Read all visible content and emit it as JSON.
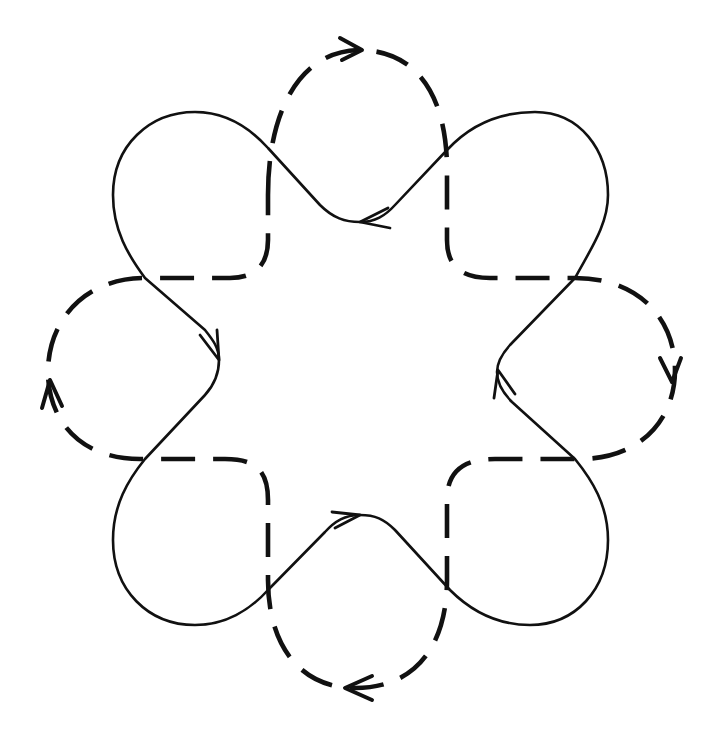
{
  "diagram": {
    "title": "Two interlinked oriented closed curves (solid and dashed) with eight-fold lobed pattern",
    "canvas": {
      "width": 714,
      "height": 739,
      "background": "#ffffff"
    },
    "curves": [
      {
        "id": "solid",
        "style": "solid",
        "color": "#111111",
        "description": "Closed curve with four outer corner lobes and four inward V-turns",
        "lobes": [
          "top-left",
          "top-right",
          "bottom-right",
          "bottom-left"
        ],
        "v_turns": [
          {
            "position": "top",
            "tip": [
              355,
              222
            ],
            "arrow": "pointing-left"
          },
          {
            "position": "right",
            "tip": [
              497,
              372
            ],
            "arrow": "pointing-up"
          },
          {
            "position": "bottom",
            "tip": [
              360,
              515
            ],
            "arrow": "pointing-right"
          },
          {
            "position": "left",
            "tip": [
              219,
              360
            ],
            "arrow": "pointing-down"
          }
        ]
      },
      {
        "id": "dashed",
        "style": "dashed",
        "color": "#111111",
        "description": "Closed dashed curve with four outer lobes (top, right, bottom, left) joined by rounded inner corners",
        "lobes": [
          {
            "position": "top",
            "extreme": [
              358,
              50
            ],
            "arrow": "pointing-right"
          },
          {
            "position": "right",
            "extreme": [
              675,
              370
            ],
            "arrow": "pointing-down"
          },
          {
            "position": "bottom",
            "extreme": [
              355,
              688
            ],
            "arrow": "pointing-left"
          },
          {
            "position": "left",
            "extreme": [
              48,
              372
            ],
            "arrow": "pointing-up"
          }
        ]
      }
    ],
    "orientation": "both curves oriented clockwise",
    "crossings": 8
  }
}
